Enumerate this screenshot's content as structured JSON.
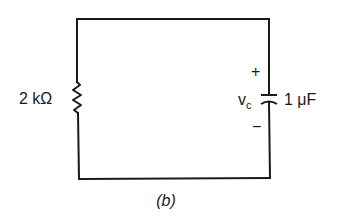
{
  "figure": {
    "caption": "(b)",
    "type": "RC circuit schematic"
  },
  "components": {
    "resistor": {
      "label": "2 kΩ",
      "value": "2",
      "unit": "kΩ"
    },
    "capacitor": {
      "label": "1 μF",
      "value": "1",
      "unit": "μF",
      "voltage_label": "v",
      "voltage_subscript": "c",
      "plus_sign": "+",
      "minus_sign": "−"
    }
  },
  "colors": {
    "wire": "#1a1a1a",
    "background": "#ffffff"
  }
}
